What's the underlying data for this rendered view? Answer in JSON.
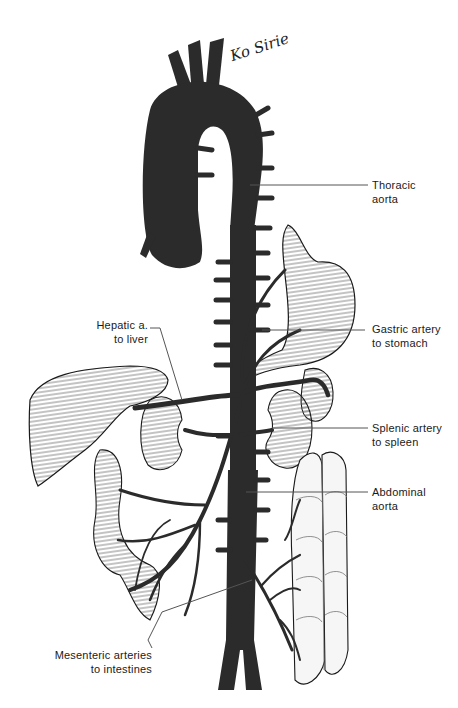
{
  "figure": {
    "colors": {
      "artery": "#2b2b2b",
      "organ_fill": "#f4f4f4",
      "organ_hatch": "#5a5a5a",
      "leader_line": "#555555",
      "background": "#ffffff"
    }
  },
  "signature": {
    "text": "Ko Sirie"
  },
  "labels": {
    "thoracic_aorta": {
      "line1": "Thoracic",
      "line2": "aorta"
    },
    "hepatic": {
      "line1": "Hepatic a.",
      "line2": "to liver"
    },
    "gastric": {
      "line1": "Gastric artery",
      "line2": "to stomach"
    },
    "splenic": {
      "line1": "Splenic artery",
      "line2": "to spleen"
    },
    "abdominal_aorta": {
      "line1": "Abdominal",
      "line2": "aorta"
    },
    "mesenteric": {
      "line1": "Mesenteric arteries",
      "line2": "to intestines"
    }
  }
}
